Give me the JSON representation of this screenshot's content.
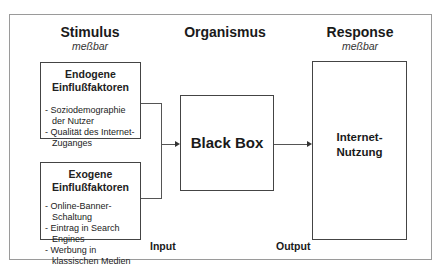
{
  "columns": {
    "stimulus": {
      "title": "Stimulus",
      "subtitle": "meßbar"
    },
    "organismus": {
      "title": "Organismus"
    },
    "response": {
      "title": "Response",
      "subtitle": "meßbar"
    }
  },
  "endogene": {
    "title_line1": "Endogene",
    "title_line2": "Einflußfaktoren",
    "items": [
      "Soziodemographie der Nutzer",
      "Qualität des Internet-Zuganges"
    ]
  },
  "exogene": {
    "title_line1": "Exogene",
    "title_line2": "Einflußfaktoren",
    "items": [
      "Online-Banner-Schaltung",
      "Eintrag in Search Engines",
      "Werbung in klassischen Medien"
    ]
  },
  "black_box": {
    "label": "Black Box"
  },
  "response_box": {
    "line1": "Internet-",
    "line2": "Nutzung"
  },
  "labels": {
    "input": "Input",
    "output": "Output"
  },
  "colors": {
    "line": "#555555",
    "frame": "#9a9a9a",
    "text": "#1a1a1a"
  }
}
